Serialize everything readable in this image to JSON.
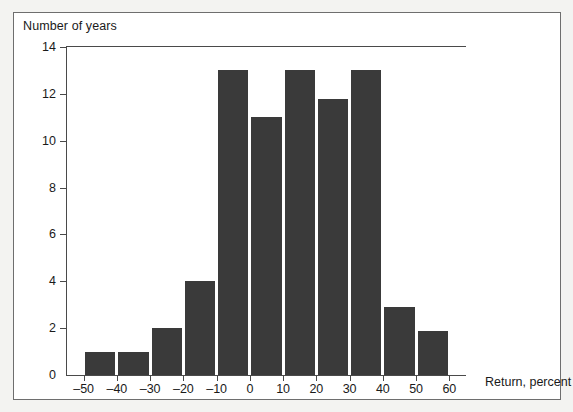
{
  "chart_data": {
    "type": "bar",
    "title": "Number of years",
    "subtitle": "",
    "xlabel": "Return, percent",
    "ylabel": "Number of years",
    "categories": [
      "-50",
      "-40",
      "-30",
      "-20",
      "-10",
      "0",
      "10",
      "20",
      "30",
      "40",
      "50"
    ],
    "values": [
      1,
      1,
      2,
      4,
      13,
      11,
      13,
      11.8,
      13,
      2.9,
      1.9
    ],
    "xlim": [
      -55,
      65
    ],
    "ylim": [
      0,
      14
    ],
    "x_ticks": [
      "–50",
      "–40",
      "–30",
      "–20",
      "–10",
      "0",
      "10",
      "20",
      "30",
      "40",
      "50",
      "60"
    ],
    "x_tick_values": [
      -50,
      -40,
      -30,
      -20,
      -10,
      0,
      10,
      20,
      30,
      40,
      50,
      60
    ],
    "y_ticks": [
      "0",
      "2",
      "4",
      "6",
      "8",
      "10",
      "12",
      "14"
    ],
    "y_tick_values": [
      0,
      2,
      4,
      6,
      8,
      10,
      12,
      14
    ],
    "grid": false,
    "legend": "none",
    "bar_color": "#3a3a3a",
    "axis_color": "#4a4a4a",
    "plot_background": "#ffffff",
    "page_background": "#f3f3f1",
    "border_color": "#6e6e6e"
  }
}
